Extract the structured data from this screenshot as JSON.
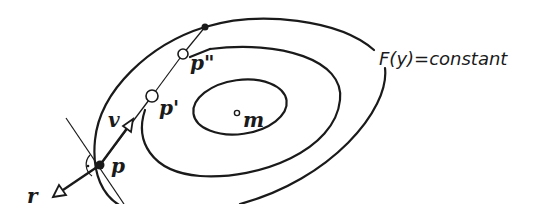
{
  "diagram": {
    "type": "contour-level-sets",
    "contour_label": "F(y)=constant",
    "labels": {
      "p": "p",
      "p_prime": "p'",
      "p_double_prime": "p\"",
      "v": "v",
      "r": "r",
      "m": "m"
    },
    "elements": {
      "contours": [
        "outer level set",
        "middle level set",
        "inner level set"
      ],
      "points": [
        "p (filled)",
        "p' (open)",
        "p\" (open)",
        "top point on outer contour (filled)",
        "m (open, minimum)"
      ],
      "vectors": [
        "v (from p toward interior)",
        "r (from p toward exterior)"
      ],
      "tangent_line": "tangent to outer contour at p with right-angle mark"
    },
    "colors": {
      "ink": "#1a1a1a",
      "background": "#ffffff"
    }
  }
}
